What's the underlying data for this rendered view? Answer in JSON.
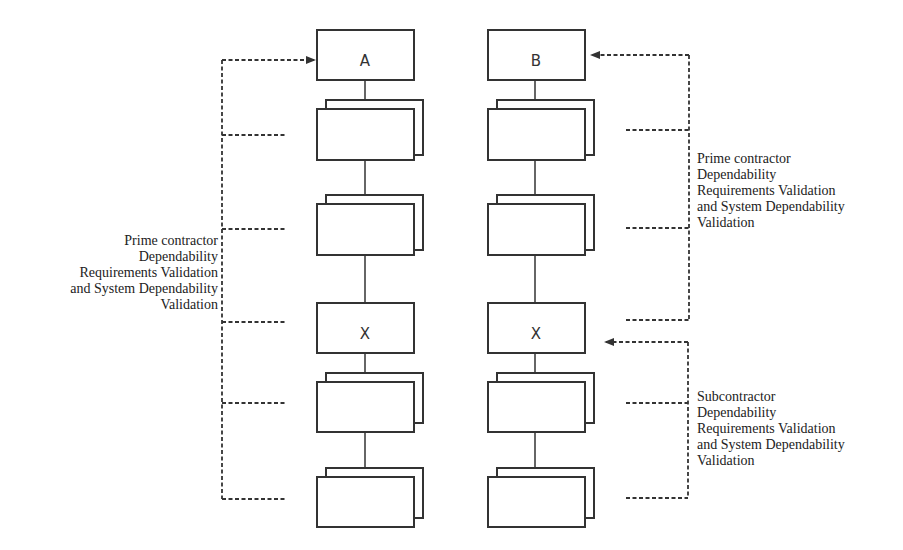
{
  "diagram": {
    "left_column": {
      "boxes": [
        {
          "label": "A",
          "stacked": false
        },
        {
          "label": "",
          "stacked": true
        },
        {
          "label": "",
          "stacked": true
        },
        {
          "label": "X",
          "stacked": false
        },
        {
          "label": "",
          "stacked": true
        },
        {
          "label": "",
          "stacked": true
        }
      ]
    },
    "right_column": {
      "boxes": [
        {
          "label": "B",
          "stacked": false
        },
        {
          "label": "",
          "stacked": true
        },
        {
          "label": "",
          "stacked": true
        },
        {
          "label": "X",
          "stacked": false
        },
        {
          "label": "",
          "stacked": true
        },
        {
          "label": "",
          "stacked": true
        }
      ]
    },
    "notes": {
      "left_prime": {
        "lines": [
          "Prime contractor",
          "Dependability",
          "Requirements Validation",
          "and System Dependability",
          "Validation"
        ]
      },
      "right_prime": {
        "lines": [
          "Prime contractor",
          "Dependability",
          "Requirements Validation",
          "and System Dependability",
          "Validation"
        ]
      },
      "right_sub": {
        "lines": [
          "Subcontractor",
          "Dependability",
          "Requirements Validation",
          "and System Dependability",
          "Validation"
        ]
      }
    },
    "colors": {
      "line": "#333333",
      "background": "#ffffff"
    }
  }
}
